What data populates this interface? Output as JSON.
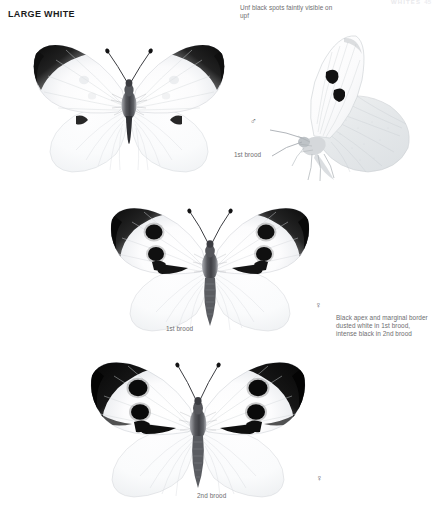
{
  "header": {
    "running_head": "WHITES",
    "page_number": "45"
  },
  "species": {
    "common_name": "LARGE WHITE"
  },
  "annotations": [
    {
      "id": "unf-spots",
      "text": "Unf black spots faintly visible on upf"
    },
    {
      "id": "black-apex",
      "text": "Black apex and marginal border dusted white in 1st brood, intense black in 2nd brood"
    }
  ],
  "specimens": [
    {
      "id": "male-upperside-1st-brood",
      "view": "upperside",
      "sex_symbol": "♂",
      "brood_label": "1st brood"
    },
    {
      "id": "male-underside-1st-brood",
      "view": "underside-side",
      "sex_symbol": "",
      "brood_label": ""
    },
    {
      "id": "female-upperside-1st-brood",
      "view": "upperside",
      "sex_symbol": "♀",
      "brood_label": "1st brood"
    },
    {
      "id": "female-upperside-2nd-brood",
      "view": "upperside",
      "sex_symbol": "♀",
      "brood_label": "2nd brood"
    }
  ],
  "colors": {
    "wing_white": "#fdfdfd",
    "wing_shade": "#d9dade",
    "apex_black": "#1a1a1a",
    "body_grey": "#6e6f73",
    "annotation_grey": "#6e6e70",
    "title_black": "#1b1b1b"
  }
}
